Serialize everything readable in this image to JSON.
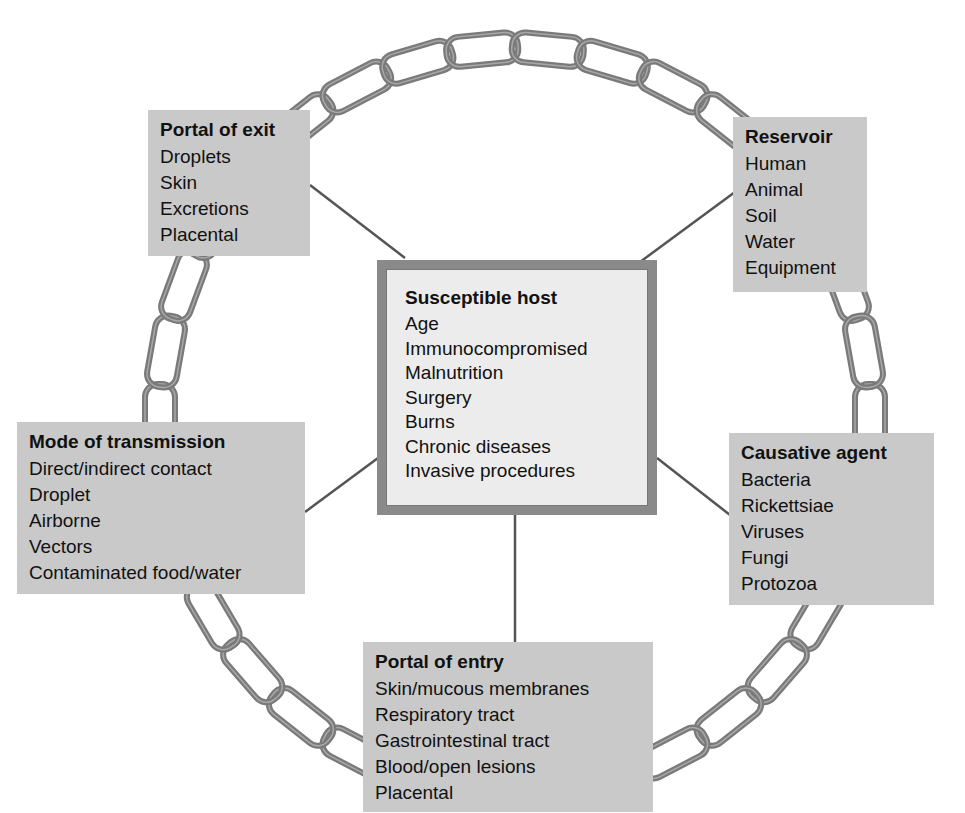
{
  "diagram": {
    "type": "chain-of-infection",
    "colors": {
      "chain": "#7a7a7a",
      "box_fill": "#c9c9c9",
      "center_fill": "#ececec",
      "center_border": "#8a8a8a",
      "connector": "#555555"
    },
    "center": {
      "title": "Susceptible host",
      "items": [
        "Age",
        "Immunocompromised",
        "Malnutrition",
        "Surgery",
        "Burns",
        "Chronic diseases",
        "Invasive procedures"
      ]
    },
    "nodes": [
      {
        "id": "portal_exit",
        "title": "Portal of exit",
        "items": [
          "Droplets",
          "Skin",
          "Excretions",
          "Placental"
        ]
      },
      {
        "id": "reservoir",
        "title": "Reservoir",
        "items": [
          "Human",
          "Animal",
          "Soil",
          "Water",
          "Equipment"
        ]
      },
      {
        "id": "mode",
        "title": "Mode of transmission",
        "items": [
          "Direct/indirect contact",
          "Droplet",
          "Airborne",
          "Vectors",
          "Contaminated food/water"
        ]
      },
      {
        "id": "causative",
        "title": "Causative agent",
        "items": [
          "Bacteria",
          "Rickettsiae",
          "Viruses",
          "Fungi",
          "Protozoa"
        ]
      },
      {
        "id": "portal_entry",
        "title": "Portal of entry",
        "items": [
          "Skin/mucous membranes",
          "Respiratory tract",
          "Gastrointestinal tract",
          "Blood/open lesions",
          "Placental"
        ]
      }
    ]
  }
}
